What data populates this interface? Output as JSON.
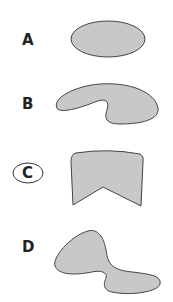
{
  "diagram": {
    "options": [
      {
        "label": "A",
        "shape": "oval",
        "selected": false
      },
      {
        "label": "B",
        "shape": "curved-kidney",
        "selected": false
      },
      {
        "label": "C",
        "shape": "notched-pentagon",
        "selected": true
      },
      {
        "label": "D",
        "shape": "twisted-blob",
        "selected": false
      }
    ],
    "colors": {
      "fill": "#c8c8c8",
      "stroke": "#444444",
      "label": "#222222"
    }
  }
}
